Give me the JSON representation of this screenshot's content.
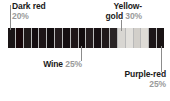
{
  "figure": {
    "type": "color-proportion-strip"
  },
  "chart_data": {
    "type": "bar",
    "title": "",
    "subtitle": "",
    "xlabel": "",
    "ylabel": "",
    "orientation": "horizontal-strip",
    "grid": false,
    "legend_position": "callouts",
    "categories": [
      "Dark red",
      "Wine",
      "Yellow-gold",
      "Purple-red"
    ],
    "values": [
      20,
      25,
      30,
      25
    ],
    "value_unit": "%",
    "annotations": [
      {
        "label": "Dark red",
        "percent": "20%",
        "position": "top-left",
        "points_to_swatch": 1
      },
      {
        "label": "Wine",
        "percent": "25%",
        "position": "bottom-left",
        "points_to_swatch": 10
      },
      {
        "label": "Yellow-gold",
        "percent": "30%",
        "position": "top-right",
        "points_to_swatch": 15
      },
      {
        "label": "Purple-red",
        "percent": "25%",
        "position": "bottom-right",
        "points_to_swatch": 20
      }
    ],
    "swatch_colors": [
      "#1a1516",
      "#17080a",
      "#201a1a",
      "#140d10",
      "#1d1517",
      "#110c0e",
      "#231b1d",
      "#150f11",
      "#1e1618",
      "#120c0e",
      "#241c1e",
      "#160f12",
      "#1f191a",
      "#2a2526",
      "#d8d6d2",
      "#e2e0dc",
      "#d2cfca",
      "#dedbd6",
      "#1c1618",
      "#191314"
    ]
  },
  "labels": {
    "dark_red": {
      "name": "Dark red",
      "percent": "20%"
    },
    "wine": {
      "name": "Wine",
      "percent": "25%"
    },
    "yellow_gold": {
      "name_line1": "Yellow-",
      "name_line2": "gold",
      "percent": "30%"
    },
    "purple_red": {
      "name": "Purple-red",
      "percent": "25%"
    }
  },
  "colors": {
    "background": "#ffffff",
    "label_text": "#1a1a1a",
    "percent_text": "#9a9a9a",
    "leader_line": "#8c8c8c",
    "swatch_divider": "#b9b9b9"
  }
}
